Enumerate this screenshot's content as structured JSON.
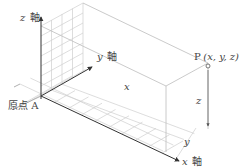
{
  "diagram": {
    "type": "3d-coordinate-system",
    "axes": {
      "x": {
        "label_var": "x",
        "label_kanji": "軸"
      },
      "y": {
        "label_var": "y",
        "label_kanji": "軸"
      },
      "z": {
        "label_var": "z",
        "label_kanji": "軸"
      }
    },
    "origin": {
      "label": "原点 A"
    },
    "point": {
      "name": "P",
      "coords": "(x, y, z)"
    },
    "dimension_labels": {
      "x": "x",
      "y": "y",
      "z": "z"
    },
    "colors": {
      "axis": "#333333",
      "grid": "#c8c8c8",
      "box": "#bdbdbd",
      "text": "#444444"
    }
  }
}
